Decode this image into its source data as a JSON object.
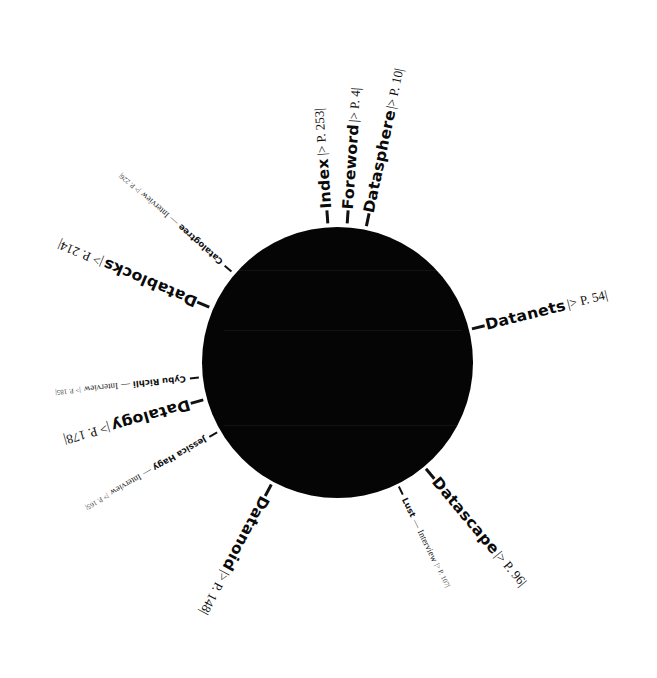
{
  "diagram": {
    "type": "radial-index",
    "hub_color": "#050505",
    "background": "#ffffff",
    "chapters": [
      {
        "title": "Index",
        "ref": "|> P. 253|",
        "kind": "chapter",
        "angle": -94
      },
      {
        "title": "Foreword",
        "ref": "|> P. 4|",
        "kind": "chapter",
        "angle": -87
      },
      {
        "title": "Datasphere",
        "ref": "|> P. 10|",
        "kind": "chapter",
        "angle": -79
      },
      {
        "title": "Datanets",
        "ref": "|> P. 54|",
        "kind": "chapter",
        "angle": -14
      },
      {
        "title": "Datascape",
        "ref": "|> P. 96|",
        "kind": "chapter",
        "angle": 50
      },
      {
        "title": "Datanoid",
        "ref": "|> P. 148|",
        "kind": "chapter",
        "angle": 118
      },
      {
        "title": "Datalogy",
        "ref": "|> P. 178|",
        "kind": "chapter",
        "angle": 164
      },
      {
        "title": "Datablocks",
        "ref": "|> P. 214|",
        "kind": "chapter",
        "angle": 203
      }
    ],
    "interviews": [
      {
        "name": "Lust",
        "label": "Interview",
        "ref": "|> P. 107|",
        "angle": 64
      },
      {
        "name": "Jessica Hagy",
        "label": "Interview",
        "ref": "|> P. 165|",
        "angle": 150
      },
      {
        "name": "Cybu Richli",
        "label": "Interview",
        "ref": "|> P. 185|",
        "angle": 174
      },
      {
        "name": "Catalogtree",
        "label": "Interview",
        "ref": "|> P. 226|",
        "angle": 221
      }
    ],
    "separator": "—"
  }
}
